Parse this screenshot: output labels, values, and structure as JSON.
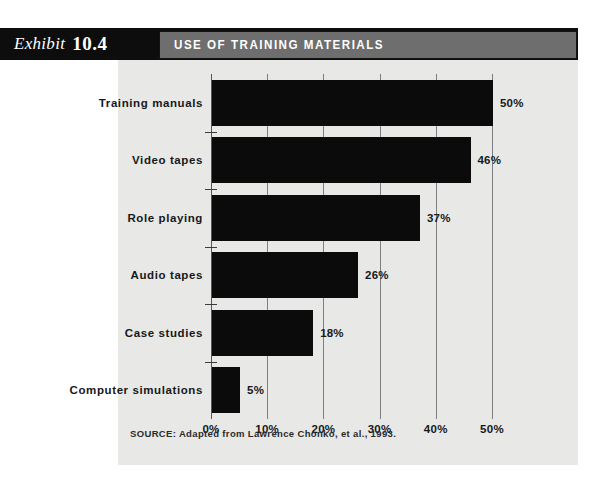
{
  "exhibit": {
    "word": "Exhibit",
    "number": "10.4"
  },
  "title": "USE OF TRAINING MATERIALS",
  "source": "SOURCE: Adapted from Lawrence Chonko, et al., 1993.",
  "colors": {
    "page_background": "#ffffff",
    "panel_background": "#e8e8e6",
    "header_strip": "#0d0d0d",
    "title_bar": "#6e6e6e",
    "title_text": "#ffffff",
    "bar_fill": "#0b0b0b",
    "gridline": "#7d7e82",
    "axis": "#55565a",
    "text": "#17181a"
  },
  "chart_data": {
    "type": "bar",
    "orientation": "horizontal",
    "title": "USE OF TRAINING MATERIALS",
    "xlabel": "",
    "ylabel": "",
    "xlim": [
      0,
      50
    ],
    "grid": true,
    "legend": "none",
    "categories": [
      "Training manuals",
      "Video tapes",
      "Role playing",
      "Audio tapes",
      "Case studies",
      "Computer simulations"
    ],
    "values": [
      50,
      46,
      37,
      26,
      18,
      5
    ],
    "value_labels": [
      "50%",
      "46%",
      "37%",
      "26%",
      "18%",
      "5%"
    ],
    "xticks": [
      0,
      10,
      20,
      30,
      40,
      50
    ],
    "xtick_labels": [
      "0%",
      "10%",
      "20%",
      "30%",
      "40%",
      "50%"
    ]
  }
}
